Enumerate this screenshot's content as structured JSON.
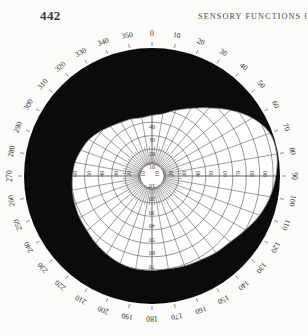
{
  "page": {
    "folio": "442",
    "running_head": "SENSORY  FUNCTIONS  OF"
  },
  "figure": {
    "name": "perimetry-visual-field-chart",
    "center_label": "",
    "blind_spot_note": ""
  },
  "chart_data": {
    "type": "line",
    "title": "",
    "subtitle": "",
    "xlabel": "",
    "ylabel": "",
    "coordinate_system": "polar",
    "angle_unit": "degrees",
    "radius_unit": "degrees of visual angle",
    "grid": true,
    "legend_position": "none",
    "angle_ticks": [
      0,
      10,
      20,
      30,
      40,
      50,
      60,
      70,
      80,
      90,
      100,
      110,
      120,
      130,
      140,
      150,
      160,
      170,
      180,
      190,
      200,
      210,
      220,
      230,
      240,
      250,
      260,
      270,
      280,
      290,
      300,
      310,
      320,
      330,
      340,
      350
    ],
    "angle_tick_labels": [
      "0",
      "10",
      "20",
      "30",
      "40",
      "50",
      "60",
      "70",
      "80",
      "90",
      "100",
      "110",
      "120",
      "130",
      "140",
      "150",
      "160",
      "170",
      "180",
      "190",
      "200",
      "210",
      "220",
      "230",
      "240",
      "250",
      "260",
      "270",
      "280",
      "290",
      "300",
      "310",
      "320",
      "330",
      "340",
      "350"
    ],
    "radial_ticks": [
      10,
      20,
      30,
      40,
      50,
      60,
      70,
      80,
      90
    ],
    "radial_tick_labels_right": [
      "10",
      "20",
      "30",
      "40",
      "50",
      "60",
      "70",
      "80",
      "90"
    ],
    "radial_tick_labels_left": [
      "10",
      "20",
      "30",
      "40",
      "50",
      "60"
    ],
    "radial_tick_labels_up": [
      "10",
      "20",
      "30",
      "40"
    ],
    "radial_tick_labels_down": [
      "10",
      "20",
      "30",
      "40",
      "50",
      "60",
      "70"
    ],
    "rlim": [
      0,
      95
    ],
    "series": [
      {
        "name": "visual-field-boundary",
        "fill": "#ffffff",
        "outside_fill": "#0b0b0b",
        "angles": [
          0,
          10,
          20,
          30,
          40,
          50,
          60,
          70,
          80,
          90,
          100,
          110,
          120,
          130,
          140,
          150,
          160,
          170,
          180,
          190,
          200,
          210,
          220,
          230,
          240,
          250,
          260,
          270,
          280,
          290,
          300,
          310,
          320,
          330,
          340,
          350
        ],
        "radii": [
          45,
          47,
          52,
          58,
          66,
          76,
          86,
          93,
          94,
          92,
          89,
          85,
          80,
          76,
          74,
          72,
          71,
          70,
          70,
          70,
          69,
          67,
          65,
          63,
          62,
          61,
          60,
          59,
          58,
          56,
          54,
          51,
          48,
          46,
          45,
          44
        ]
      }
    ],
    "center_blind_spot_radius": 9,
    "colors": {
      "ink": "#0b0b0b",
      "grid": "#5e5e5e",
      "field": "#ffffff",
      "paper": "#fbfbf9",
      "text": "#2e2e2e"
    }
  }
}
